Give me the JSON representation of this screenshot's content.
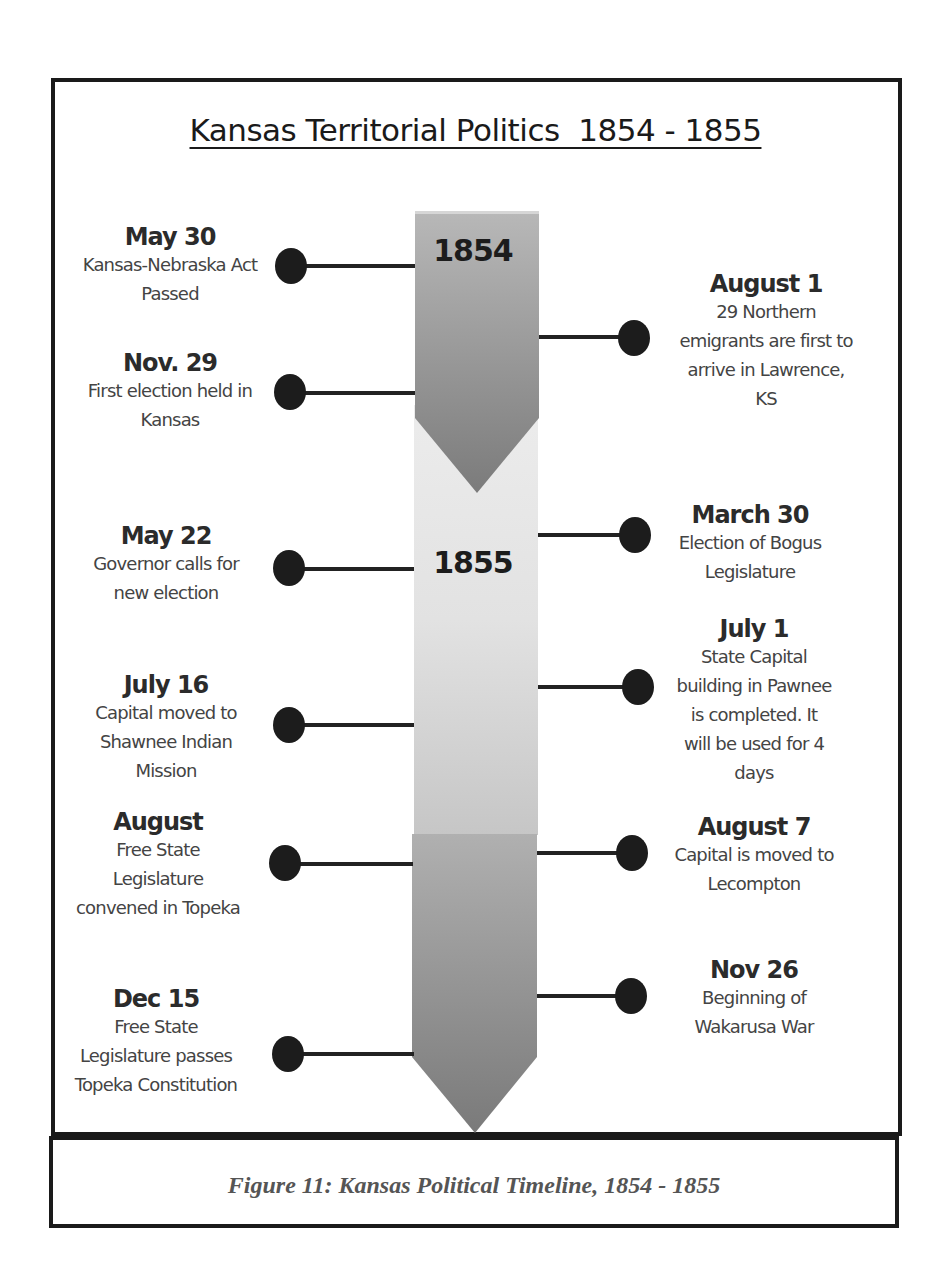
{
  "title": "Kansas Territorial Politics  1854 - 1855",
  "caption": "Figure 11:  Kansas Political Timeline, 1854 - 1855",
  "colors": {
    "frame": "#1a1a1a",
    "bar_dark": "#7a7a7a",
    "bar_light": "#e8e8e8",
    "dot": "#1c1c1c"
  },
  "timeline": {
    "years": [
      {
        "label": "1854"
      },
      {
        "label": "1855"
      }
    ],
    "left_events": [
      {
        "date": "May 30",
        "description": "Kansas-Nebraska Act\nPassed"
      },
      {
        "date": "Nov. 29",
        "description": "First election held in\nKansas"
      },
      {
        "date": "May 22",
        "description": "Governor calls for\nnew election"
      },
      {
        "date": "July 16",
        "description": "Capital moved to\nShawnee Indian\nMission"
      },
      {
        "date": "August",
        "description": "Free State\nLegislature\nconvened in Topeka"
      },
      {
        "date": "Dec 15",
        "description": "Free State\nLegislature passes\nTopeka Constitution"
      }
    ],
    "right_events": [
      {
        "date": "August 1",
        "description": "29 Northern\nemigrants are first to\narrive in Lawrence,\nKS"
      },
      {
        "date": "March 30",
        "description": "Election of Bogus\nLegislature"
      },
      {
        "date": "July 1",
        "description": "State Capital\nbuilding in Pawnee\nis completed.  It\nwill be used for 4\ndays"
      },
      {
        "date": "August 7",
        "description": "Capital is moved to\nLecompton"
      },
      {
        "date": "Nov 26",
        "description": "Beginning of\nWakarusa War"
      }
    ]
  }
}
